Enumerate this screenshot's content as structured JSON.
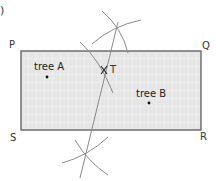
{
  "figure": {
    "fragment_label": ")",
    "rectangle": {
      "corners": {
        "P": "P",
        "Q": "Q",
        "R": "R",
        "S": "S"
      },
      "fill": "#e6e6e6",
      "grid_color": "#f6f6f6",
      "border_color": "#666666"
    },
    "trees": [
      {
        "label": "tree A"
      },
      {
        "label": "tree B"
      }
    ],
    "point_T": {
      "label": "T",
      "mark": "X"
    },
    "construction_color": "#8a8a8a"
  }
}
